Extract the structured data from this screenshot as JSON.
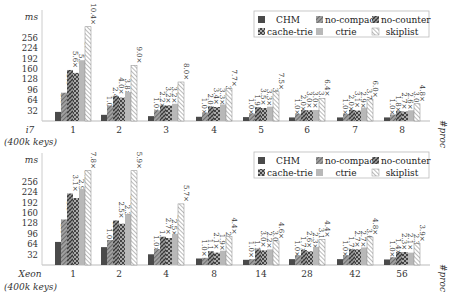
{
  "chart_data": [
    {
      "type": "bar",
      "title": "",
      "machine_label": "i7",
      "subtitle": "(400k keys)",
      "ylabel": "ms",
      "xlabel": "#proc",
      "yticks": [
        32,
        64,
        96,
        128,
        160,
        192,
        224,
        256
      ],
      "ylim": [
        0,
        290
      ],
      "grid": false,
      "legend_position": "upper right",
      "categories": [
        "1",
        "2",
        "3",
        "4",
        "5",
        "6",
        "7",
        "8"
      ],
      "series": [
        {
          "name": "CHM",
          "values": [
            28,
            19,
            15,
            13,
            12,
            11,
            11,
            11
          ]
        },
        {
          "name": "no-compact",
          "values": [
            87,
            46,
            33,
            26,
            23,
            22,
            22,
            20
          ]
        },
        {
          "name": "no-counter",
          "values": [
            157,
            76,
            48,
            44,
            42,
            33,
            34,
            30
          ]
        },
        {
          "name": "cache-trie",
          "values": [
            148,
            72,
            48,
            43,
            40,
            33,
            32,
            29
          ]
        },
        {
          "name": "ctrie",
          "values": [
            187,
            89,
            53,
            51,
            44,
            34,
            41,
            33
          ]
        },
        {
          "name": "skiplist",
          "values": [
            290,
            171,
            120,
            100,
            90,
            70,
            66,
            53
          ]
        }
      ],
      "annotations": [
        [
          "1.0×",
          "3.1×",
          "5.6×",
          "5.3×",
          "6.7×",
          "10.4×"
        ],
        [
          "1.0×",
          "2.4×",
          "4.0×",
          "3.8×",
          "4.7×",
          "9.0×"
        ],
        [
          "1.0×",
          "2.2×",
          "3.2×",
          "3.2×",
          "3.5×",
          "8.0×"
        ],
        [
          "1.0×",
          "2.0×",
          "3.4×",
          "3.3×",
          "3.9×",
          "7.7×"
        ],
        [
          "1.0×",
          "1.9×",
          "3.5×",
          "3.3×",
          "3.7×",
          "7.5×"
        ],
        [
          "1.0×",
          "2.0×",
          "3.0×",
          "3.0×",
          "3.1×",
          "6.4×"
        ],
        [
          "1.0×",
          "2.0×",
          "3.1×",
          "2.9×",
          "3.7×",
          "6.0×"
        ],
        [
          "1.0×",
          "1.8×",
          "2.7×",
          "2.6×",
          "3.0×",
          "4.8×"
        ]
      ]
    },
    {
      "type": "bar",
      "title": "",
      "machine_label": "Xeon",
      "subtitle": "(400k keys)",
      "ylabel": "ms",
      "xlabel": "#proc",
      "yticks": [
        32,
        64,
        96,
        128,
        160,
        192,
        224,
        256
      ],
      "ylim": [
        0,
        290
      ],
      "grid": false,
      "legend_position": "upper right",
      "categories": [
        "1",
        "2",
        "4",
        "8",
        "14",
        "28",
        "42",
        "56"
      ],
      "series": [
        {
          "name": "CHM",
          "values": [
            71,
            55,
            33,
            20,
            16,
            18,
            18,
            17
          ]
        },
        {
          "name": "no-compact",
          "values": [
            140,
            77,
            49,
            22,
            18,
            30,
            30,
            24
          ]
        },
        {
          "name": "no-counter",
          "values": [
            220,
            137,
            87,
            42,
            48,
            46,
            48,
            40
          ]
        },
        {
          "name": "cache-trie",
          "values": [
            206,
            127,
            83,
            38,
            45,
            42,
            48,
            40
          ]
        },
        {
          "name": "ctrie",
          "values": [
            234,
            156,
            96,
            44,
            48,
            56,
            54,
            38
          ]
        },
        {
          "name": "skiplist",
          "values": [
            290,
            290,
            188,
            88,
            74,
            79,
            86,
            66
          ]
        }
      ],
      "annotations": [
        [
          "1.0×",
          "1.9×",
          "3.1×",
          "2.9×",
          "3.2×",
          "7.8×"
        ],
        [
          "1.0×",
          "1.4×",
          "2.5×",
          "2.3×",
          "2.8×",
          "5.9×"
        ],
        [
          "1.0×",
          "1.5×",
          "2.7×",
          "2.5×",
          "2.9×",
          "5.7×"
        ],
        [
          "1.0×",
          "1.1×",
          "2.1×",
          "1.9×",
          "2.2×",
          "4.4×"
        ],
        [
          "1.0×",
          "1.1×",
          "3.0×",
          "2.2×",
          "3.0×",
          "4.6×"
        ],
        [
          "1.0×",
          "1.7×",
          "2.6×",
          "2.3×",
          "3.1×",
          "4.4×"
        ],
        [
          "1.0×",
          "1.7×",
          "2.7×",
          "2.7×",
          "3.0×",
          "4.8×"
        ],
        [
          "1.0×",
          "1.4×",
          "2.3×",
          "2.1×",
          "2.3×",
          "3.9×"
        ]
      ]
    }
  ],
  "legend": {
    "items": [
      {
        "name": "CHM",
        "pattern": "solid-dark"
      },
      {
        "name": "no-compact",
        "pattern": "diagonal"
      },
      {
        "name": "no-counter",
        "pattern": "crosshatch-dark"
      },
      {
        "name": "cache-trie",
        "pattern": "checker"
      },
      {
        "name": "ctrie",
        "pattern": "solid-light"
      },
      {
        "name": "skiplist",
        "pattern": "diagonal-light"
      }
    ]
  },
  "colors": {
    "chm": "#4a4a4a",
    "no_compact": "#8a8a8a",
    "no_counter": "#5a5a5a",
    "cache_trie": "#6e6e6e",
    "ctrie": "#b8b8b8",
    "skiplist": "#ffffff",
    "axis": "#999999",
    "text": "#222222"
  }
}
